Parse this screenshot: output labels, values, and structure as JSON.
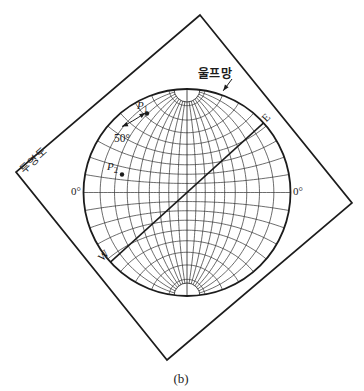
{
  "figure": {
    "caption": "(b)",
    "ink": "#1c1c1c",
    "grid_ink": "#2e2e2e",
    "background": "#ffffff"
  },
  "frame": {
    "label": "투영도",
    "vertices": [
      [
        200,
        15
      ],
      [
        352,
        203
      ],
      [
        167,
        360
      ],
      [
        16,
        172
      ]
    ]
  },
  "net": {
    "label": "울프망",
    "center_x": 187,
    "center_y": 192.5,
    "radius": 103.5,
    "grid_step_deg": 10,
    "pole_hole_radius": 13,
    "axis_labels": {
      "east": "E",
      "west": "W",
      "left_zero": "0°",
      "right_zero": "0°"
    },
    "diagonal": {
      "x1": 110.4,
      "y1": 262.1,
      "x2": 263.6,
      "y2": 122.9
    }
  },
  "annotations": {
    "angle_label": "50°",
    "p1": {
      "text": "P",
      "sub": "1",
      "dot_x": 147,
      "dot_y": 113.5
    },
    "p2": {
      "text": "P",
      "sub": "2",
      "dot_x": 122,
      "dot_y": 174.5
    },
    "pointer_arrow": {
      "x1": 232,
      "y1": 79,
      "x2": 223.2,
      "y2": 90.8
    },
    "angle_arc": {
      "ax": 122,
      "ay": 126.5,
      "cx": 132,
      "cy": 122,
      "bx": 145.3,
      "by": 112.8
    }
  }
}
